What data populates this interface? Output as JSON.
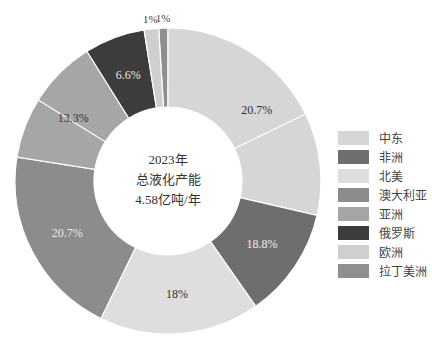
{
  "chart_data": {
    "type": "pie",
    "variant": "donut",
    "title": "",
    "center_label": [
      "2023年",
      "总液化产能",
      "4.58亿吨/年"
    ],
    "categories": [
      "中东",
      "非洲",
      "北美",
      "澳大利亚",
      "亚洲",
      "俄罗斯",
      "欧洲",
      "拉丁美洲"
    ],
    "values": [
      20.7,
      18.8,
      18,
      20.7,
      13.3,
      6.6,
      1,
      1
    ],
    "unit": "%",
    "legend_position": "right",
    "colors": {
      "中东": "#d6d6d6",
      "非洲": "#6e6e6e",
      "北美": "#dedede",
      "澳大利亚": "#8c8c8c",
      "亚洲": "#a6a6a6",
      "俄罗斯": "#3c3c3c",
      "欧洲": "#cfcfcf",
      "拉丁美洲": "#8f8f8f"
    },
    "segments": [
      {
        "name": "拉丁美洲",
        "label": "1%",
        "start": -3.5,
        "end": 0,
        "color": "#8f8f8f",
        "label_color": "#333333",
        "label_outside": true
      },
      {
        "name": "中东",
        "label": "20.7%",
        "start": 0,
        "end": 103,
        "color": "#d6d6d6",
        "label_color": "#333333",
        "inner_line": 64
      },
      {
        "name": "非洲",
        "label": "18.8%",
        "start": 103,
        "end": 145,
        "color": "#6e6e6e",
        "label_color": "#f0f0f0"
      },
      {
        "name": "北美",
        "label": "18%",
        "start": 145,
        "end": 206,
        "color": "#dedede",
        "label_color": "#333333"
      },
      {
        "name": "澳大利亚",
        "label": "20.7%",
        "start": 206,
        "end": 279,
        "color": "#8c8c8c",
        "label_color": "#e8e8e8"
      },
      {
        "name": "亚洲",
        "label": "13.3%",
        "start": 279,
        "end": 328,
        "color": "#a6a6a6",
        "label_color": "#333333",
        "inner_line": 302
      },
      {
        "name": "俄罗斯",
        "label": "6.6%",
        "start": 328,
        "end": 351,
        "color": "#3c3c3c",
        "label_color": "#e8e8e8"
      },
      {
        "name": "欧洲",
        "label": "1%",
        "start": 351,
        "end": 356.5,
        "color": "#cfcfcf",
        "label_color": "#333333",
        "label_outside": true
      }
    ],
    "geometry": {
      "cx": 168,
      "cy": 181,
      "outer_r": 153,
      "inner_r": 74
    }
  },
  "center": {
    "line1": "2023年",
    "line2": "总液化产能",
    "line3": "4.58亿吨/年"
  },
  "legend": {
    "items": [
      {
        "label": "中东",
        "color": "#d6d6d6"
      },
      {
        "label": "非洲",
        "color": "#6e6e6e"
      },
      {
        "label": "北美",
        "color": "#dedede"
      },
      {
        "label": "澳大利亚",
        "color": "#8c8c8c"
      },
      {
        "label": "亚洲",
        "color": "#a6a6a6"
      },
      {
        "label": "俄罗斯",
        "color": "#3c3c3c"
      },
      {
        "label": "欧洲",
        "color": "#cfcfcf"
      },
      {
        "label": "拉丁美洲",
        "color": "#8f8f8f"
      }
    ]
  }
}
